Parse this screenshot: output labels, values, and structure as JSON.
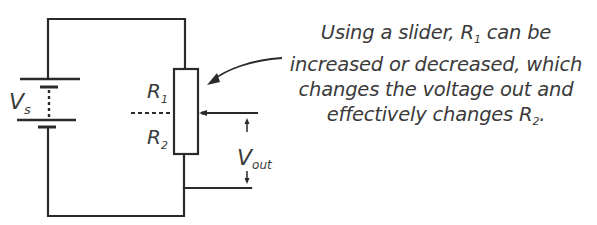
{
  "diagram": {
    "type": "potential-divider-circuit",
    "labels": {
      "supply": {
        "main": "V",
        "sub": "s"
      },
      "r1": {
        "main": "R",
        "sub": "1"
      },
      "r2": {
        "main": "R",
        "sub": "2"
      },
      "vout": {
        "main": "V",
        "sub": "out"
      }
    },
    "annotation": {
      "line1_pre": "Using a slider, R",
      "line1_sub": "1",
      "line1_post": " can be",
      "line2": "increased or decreased, which",
      "line3": "changes the voltage out and",
      "line4_pre": "effectively changes R",
      "line4_sub": "2",
      "line4_post": "."
    },
    "components": [
      "battery",
      "variable-resistor (potentiometer)",
      "slider/wiper",
      "output terminals"
    ],
    "colors": {
      "line": "#2a2a2a",
      "text": "#3a3a3a",
      "background": "#ffffff"
    }
  }
}
